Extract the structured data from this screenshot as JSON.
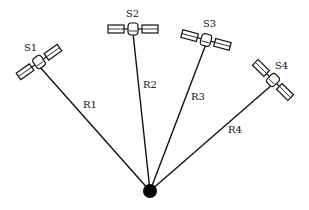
{
  "diagram": {
    "receiver": {
      "x": 150,
      "y": 191,
      "r": 7,
      "color": "#000000"
    },
    "satellites": [
      {
        "label": "S1",
        "x": 39,
        "y": 62,
        "angle": -35,
        "label_x": 24,
        "label_y": 51
      },
      {
        "label": "S2",
        "x": 133,
        "y": 29,
        "angle": 0,
        "label_x": 126,
        "label_y": 17
      },
      {
        "label": "S3",
        "x": 206,
        "y": 40,
        "angle": 15,
        "label_x": 203,
        "label_y": 27
      },
      {
        "label": "S4",
        "x": 273,
        "y": 80,
        "angle": 45,
        "label_x": 275,
        "label_y": 69
      }
    ],
    "ranges": [
      {
        "label": "R1",
        "label_x": 83,
        "label_y": 108
      },
      {
        "label": "R2",
        "label_x": 143,
        "label_y": 88
      },
      {
        "label": "R3",
        "label_x": 191,
        "label_y": 100
      },
      {
        "label": "R4",
        "label_x": 228,
        "label_y": 133
      }
    ]
  }
}
